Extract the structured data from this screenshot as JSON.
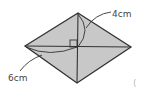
{
  "diagram": {
    "shape": "rhombus",
    "fill": "#c8c8c8",
    "stroke": "#333333",
    "labels": {
      "half_vertical": "4cm",
      "half_horizontal": "6cm",
      "paren": "("
    },
    "right_angle_marker": true
  }
}
